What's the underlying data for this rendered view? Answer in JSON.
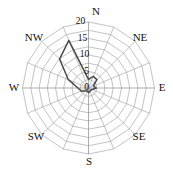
{
  "chart_data": {
    "type": "line",
    "subtype": "wind-rose-polar",
    "title": "",
    "xlabel": "",
    "ylabel": "",
    "grid": true,
    "legend": false,
    "rlim": [
      0,
      20
    ],
    "r_ticks": [
      0,
      5,
      10,
      15,
      20
    ],
    "r_tick_labels": [
      "0",
      "5",
      "10",
      "15",
      "20"
    ],
    "r_tick_label_angle_deg": 352,
    "theta_zero_location": "N",
    "theta_direction": "clockwise",
    "n_sectors": 16,
    "direction_labels": [
      "N",
      "NE",
      "E",
      "SE",
      "S",
      "SW",
      "W",
      "NW"
    ],
    "direction_label_angles_deg": [
      0,
      45,
      90,
      135,
      180,
      225,
      270,
      315
    ],
    "sector_labels": [
      "N",
      "NNE",
      "NE",
      "ENE",
      "E",
      "ESE",
      "SE",
      "SSE",
      "S",
      "SSW",
      "SW",
      "WSW",
      "W",
      "WNW",
      "NW",
      "NNW"
    ],
    "sector_angles_deg": [
      0,
      22.5,
      45,
      67.5,
      90,
      112.5,
      135,
      157.5,
      180,
      202.5,
      225,
      247.5,
      270,
      292.5,
      315,
      337.5
    ],
    "categories": [
      "N",
      "NNE",
      "NE",
      "ENE",
      "E",
      "ESE",
      "SE",
      "SSE",
      "S",
      "SSW",
      "SW",
      "WSW",
      "W",
      "WNW",
      "NW",
      "NNW"
    ],
    "values": [
      2.6,
      3.8,
      3.6,
      1.6,
      2.3,
      1.2,
      0.9,
      1.1,
      1.4,
      1.0,
      1.3,
      2.4,
      3.2,
      6.6,
      12.4,
      15.6
    ],
    "series": [
      {
        "name": "frequency",
        "values": [
          2.6,
          3.8,
          3.6,
          1.6,
          2.3,
          1.2,
          0.9,
          1.1,
          1.4,
          1.0,
          1.3,
          2.4,
          3.2,
          6.6,
          12.4,
          15.6
        ]
      }
    ],
    "colors": {
      "data_line": "#4a4a4a",
      "grid": "#9a9a9a",
      "text": "#111111",
      "background": "#ffffff"
    }
  },
  "geometry": {
    "cx": 88.5,
    "cy": 88.0,
    "r_max_px": 66,
    "r_max_value": 20
  },
  "labels": {
    "n": "N",
    "ne": "NE",
    "e": "E",
    "se": "SE",
    "s": "S",
    "sw": "SW",
    "w": "W",
    "nw": "NW",
    "r0": "0",
    "r5": "5",
    "r10": "10",
    "r15": "15",
    "r20": "20"
  }
}
